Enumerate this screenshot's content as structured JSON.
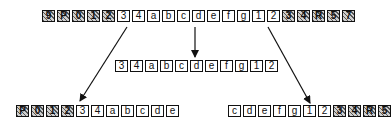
{
  "diagram": {
    "source_row": {
      "cells": [
        {
          "label": "9",
          "hatched": true
        },
        {
          "label": "P",
          "hatched": true
        },
        {
          "label": "0",
          "hatched": true
        },
        {
          "label": "1",
          "hatched": true
        },
        {
          "label": "2",
          "hatched": true
        },
        {
          "label": "3",
          "hatched": false
        },
        {
          "label": "4",
          "hatched": false
        },
        {
          "label": "a",
          "hatched": false
        },
        {
          "label": "b",
          "hatched": false
        },
        {
          "label": "c",
          "hatched": false
        },
        {
          "label": "d",
          "hatched": false
        },
        {
          "label": "e",
          "hatched": false
        },
        {
          "label": "f",
          "hatched": false
        },
        {
          "label": "g",
          "hatched": false
        },
        {
          "label": "1",
          "hatched": false
        },
        {
          "label": "2",
          "hatched": false
        },
        {
          "label": "3",
          "hatched": true
        },
        {
          "label": "4",
          "hatched": true
        },
        {
          "label": "R",
          "hatched": true
        },
        {
          "label": "5",
          "hatched": true
        },
        {
          "label": "7",
          "hatched": true
        }
      ]
    },
    "middle_row": {
      "cells": [
        {
          "label": "3",
          "hatched": false
        },
        {
          "label": "4",
          "hatched": false
        },
        {
          "label": "a",
          "hatched": false
        },
        {
          "label": "b",
          "hatched": false
        },
        {
          "label": "c",
          "hatched": false
        },
        {
          "label": "d",
          "hatched": false
        },
        {
          "label": "e",
          "hatched": false
        },
        {
          "label": "f",
          "hatched": false
        },
        {
          "label": "g",
          "hatched": false
        },
        {
          "label": "1",
          "hatched": false
        },
        {
          "label": "2",
          "hatched": false
        }
      ]
    },
    "left_row": {
      "cells": [
        {
          "label": "P",
          "hatched": true
        },
        {
          "label": "0",
          "hatched": true
        },
        {
          "label": "1",
          "hatched": true
        },
        {
          "label": "2",
          "hatched": true
        },
        {
          "label": "3",
          "hatched": false
        },
        {
          "label": "4",
          "hatched": false
        },
        {
          "label": "a",
          "hatched": false
        },
        {
          "label": "b",
          "hatched": false
        },
        {
          "label": "c",
          "hatched": false
        },
        {
          "label": "d",
          "hatched": false
        },
        {
          "label": "e",
          "hatched": false
        }
      ]
    },
    "right_row": {
      "cells": [
        {
          "label": "c",
          "hatched": false
        },
        {
          "label": "d",
          "hatched": false
        },
        {
          "label": "e",
          "hatched": false
        },
        {
          "label": "f",
          "hatched": false
        },
        {
          "label": "g",
          "hatched": false
        },
        {
          "label": "1",
          "hatched": false
        },
        {
          "label": "2",
          "hatched": false
        },
        {
          "label": "3",
          "hatched": true
        },
        {
          "label": "4",
          "hatched": true
        },
        {
          "label": "R",
          "hatched": true
        },
        {
          "label": "5",
          "hatched": true
        }
      ]
    },
    "arrows": [
      {
        "name": "arrow-down-center",
        "x1": 195,
        "y1": 27,
        "x2": 195,
        "y2": 57
      },
      {
        "name": "arrow-down-left",
        "x1": 127,
        "y1": 27,
        "x2": 80,
        "y2": 101
      },
      {
        "name": "arrow-down-right",
        "x1": 268,
        "y1": 27,
        "x2": 310,
        "y2": 103
      }
    ],
    "colors": {
      "stroke": "#111111",
      "hatch": "#555555",
      "hatch_bg": "#cfcfcf"
    }
  }
}
